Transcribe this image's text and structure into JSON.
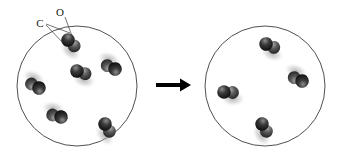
{
  "diagram": {
    "background_color": "#ffffff",
    "outline_color": "#3c3c3c",
    "arrow_color": "#000000",
    "atom_dark_color": "#1c1c1c",
    "atom_mid_color": "#4a4a4a",
    "shadow_color": "#b9b9b9"
  },
  "labels": {
    "carbon": "C",
    "oxygen": "O"
  },
  "containers": [
    {
      "name": "left-container",
      "cx": 77,
      "cy": 86,
      "r": 60,
      "molecule_count": 6,
      "molecules": [
        {
          "name": "molecule-1",
          "x": 68,
          "y": 40,
          "angle": 40
        },
        {
          "name": "molecule-2",
          "x": 77,
          "y": 71,
          "angle": 15
        },
        {
          "name": "molecule-3",
          "x": 115,
          "y": 69,
          "angle": 200
        },
        {
          "name": "molecule-4",
          "x": 39,
          "y": 88,
          "angle": 205
        },
        {
          "name": "molecule-5",
          "x": 61,
          "y": 117,
          "angle": 190
        },
        {
          "name": "molecule-6",
          "x": 105,
          "y": 124,
          "angle": 55
        }
      ]
    },
    {
      "name": "right-container",
      "cx": 265,
      "cy": 86,
      "r": 60,
      "molecule_count": 4,
      "molecules": [
        {
          "name": "molecule-1",
          "x": 266,
          "y": 44,
          "angle": 20
        },
        {
          "name": "molecule-2",
          "x": 224,
          "y": 92,
          "angle": 0
        },
        {
          "name": "molecule-3",
          "x": 302,
          "y": 81,
          "angle": 200
        },
        {
          "name": "molecule-4",
          "x": 262,
          "y": 124,
          "angle": 55
        }
      ]
    }
  ],
  "arrow": {
    "name": "transition-arrow",
    "x1": 156,
    "x2": 189,
    "y": 85,
    "direction": "right"
  },
  "leaders": {
    "oxygen_label_pos": {
      "x": 63,
      "y": 13
    },
    "carbon_label_pos": {
      "x": 41,
      "y": 25
    },
    "oxygen_target": {
      "x": 72,
      "y": 36
    },
    "carbon_target": {
      "x": 62,
      "y": 42
    },
    "carbon_target_2": {
      "x": 70,
      "y": 32
    }
  }
}
